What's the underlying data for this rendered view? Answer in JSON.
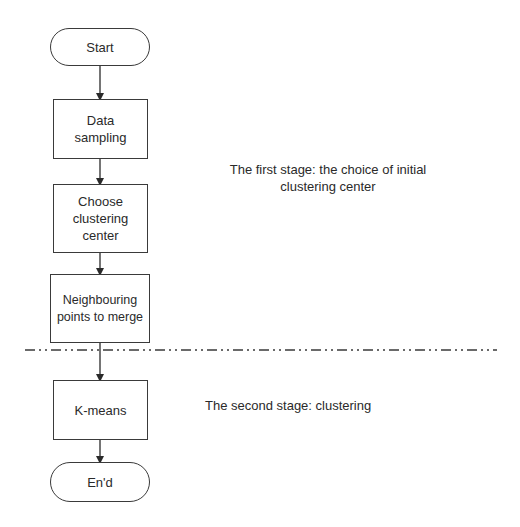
{
  "diagram": {
    "type": "flowchart",
    "nodes": {
      "start": "Start",
      "data_sampling": "Data sampling",
      "choose_center": "Choose clustering center",
      "merge": "Neighbouring points to merge",
      "kmeans": "K-means",
      "end": "En'd"
    },
    "stages": {
      "first": "The first stage: the choice of initial clustering center",
      "second": "The second stage: clustering"
    },
    "colors": {
      "stroke": "#3a3a3a",
      "text": "#2a2a2a",
      "background": "#ffffff"
    }
  }
}
